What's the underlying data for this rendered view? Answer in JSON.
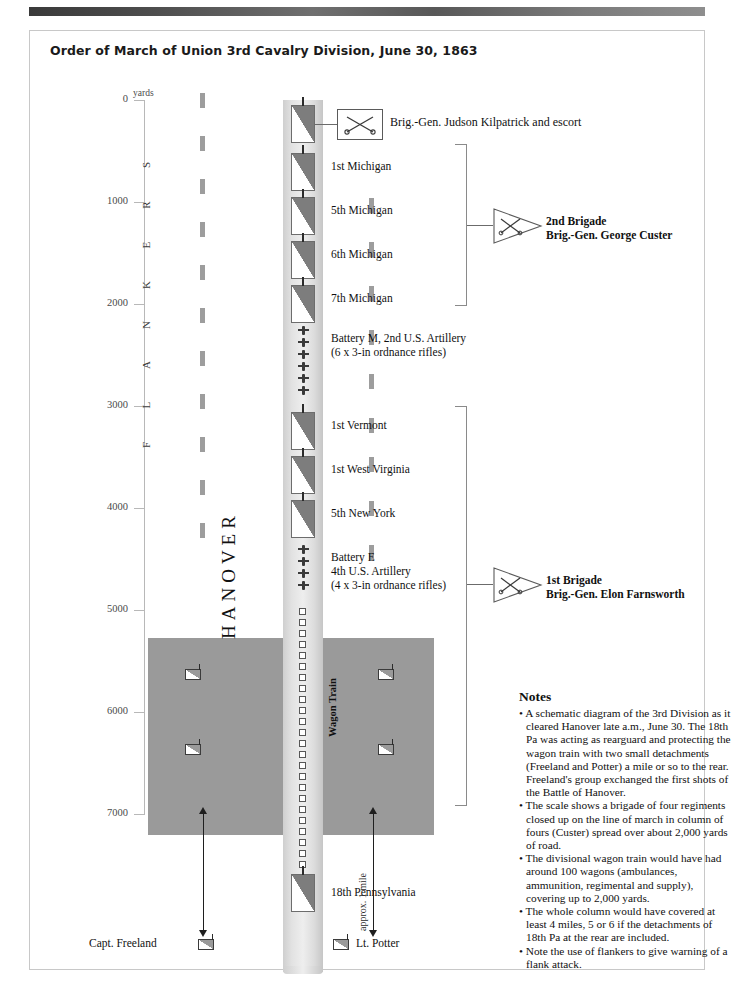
{
  "title": "Order of March of Union 3rd Cavalry Division, June 30, 1863",
  "scale": {
    "unit_label": "yards",
    "ticks": [
      "0",
      "1000",
      "2000",
      "3000",
      "4000",
      "5000",
      "6000",
      "7000"
    ],
    "min": 0,
    "max": 7000
  },
  "flankers": {
    "word": "FLANKERS",
    "letters": [
      "S",
      "R",
      "E",
      "K",
      "N",
      "A",
      "L",
      "F"
    ]
  },
  "column": {
    "hq": {
      "symbol": "crossed-sabers-box",
      "label": "Brig.-Gen. Judson Kilpatrick and escort"
    },
    "units": [
      {
        "type": "regiment",
        "label": "1st Michigan"
      },
      {
        "type": "regiment",
        "label": "5th Michigan"
      },
      {
        "type": "regiment",
        "label": "6th Michigan"
      },
      {
        "type": "regiment",
        "label": "7th Michigan"
      },
      {
        "type": "battery",
        "label": "Battery M, 2nd U.S. Artillery",
        "label2": "(6 x 3-in ordnance rifles)",
        "guns": 6
      },
      {
        "type": "regiment",
        "label": "1st Vermont"
      },
      {
        "type": "regiment",
        "label": "1st West Virginia"
      },
      {
        "type": "regiment",
        "label": "5th New York"
      },
      {
        "type": "battery",
        "label": "Battery E",
        "label2": "4th U.S. Artillery",
        "label3": "(4 x 3-in ordnance rifles)",
        "guns": 4
      },
      {
        "type": "wagons",
        "label": "Wagon Train",
        "count": 24
      },
      {
        "type": "regiment",
        "label": "18th Pennsylvania"
      }
    ]
  },
  "brigades": [
    {
      "name": "2nd Brigade",
      "commander": "Brig.-Gen. George Custer",
      "symbol": "crossed-sabers-pennant"
    },
    {
      "name": "1st Brigade",
      "commander": "Brig.-Gen. Elon Farnsworth",
      "symbol": "crossed-sabers-pennant"
    }
  ],
  "town": {
    "name": "HANOVER"
  },
  "detachments": {
    "left": {
      "label": "Capt. Freeland"
    },
    "right": {
      "label": "Lt. Potter"
    },
    "distance_label": "approx. 1 mile"
  },
  "notes": {
    "heading": "Notes",
    "items": [
      "• A schematic diagram of the 3rd Division as it cleared Hanover late a.m., June 30. The 18th Pa was acting as rearguard and protecting the wagon train with two small detachments (Freeland and Potter) a mile or so to the rear. Freeland's group exchanged the first shots of the Battle of Hanover.",
      "• The scale shows a brigade of four regiments closed up on the line of march in column of fours (Custer) spread over about 2,000 yards of road.",
      "• The divisional wagon train would have had around 100 wagons (ambulances, ammunition, regimental and supply), covering up to 2,000 yards.",
      "• The whole column would have covered at least 4 miles, 5 or 6 if the detachments of 18th Pa at the rear are included.",
      "• Note the use of flankers to give warning of a flank attack."
    ]
  },
  "colors": {
    "town": "#9a9a9a",
    "road": "#e2e2e2",
    "flag_dark": "#7d7d7d",
    "axis": "#b8b8b8"
  }
}
